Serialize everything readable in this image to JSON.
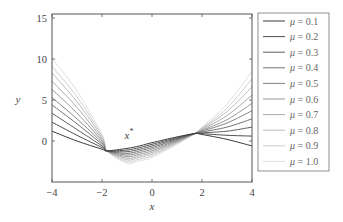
{
  "chart_data": {
    "type": "line",
    "title": "",
    "xlabel": "x",
    "ylabel": "y",
    "xlim": [
      -4,
      4
    ],
    "ylim": [
      -5,
      15.5
    ],
    "xticks": [
      -4,
      -2,
      0,
      2,
      4
    ],
    "yticks": [
      0,
      5,
      10,
      15
    ],
    "xtick_labels": [
      "−4",
      "−2",
      "0",
      "2",
      "4"
    ],
    "ytick_labels": [
      "0",
      "5",
      "10",
      "15"
    ],
    "grid": false,
    "legend_position": "outside-right",
    "annotation": {
      "text": "x",
      "superscript": "*",
      "x": -1.1,
      "y": 0.3
    },
    "x": [
      -4,
      -3,
      -2,
      -1.8,
      -1,
      -0.5,
      0,
      1,
      1.7,
      2,
      3,
      4
    ],
    "series": [
      {
        "name": "μ = 0.1",
        "label_mu": "μ",
        "label_value": "= 0.1",
        "color": "#3a3a3a",
        "values": [
          1.2,
          0.0,
          -1.0,
          -1.2,
          -0.9,
          -0.6,
          -0.2,
          0.5,
          0.9,
          0.8,
          0.2,
          -0.6
        ]
      },
      {
        "name": "μ = 0.2",
        "label_mu": "μ",
        "label_value": "= 0.2",
        "color": "#4d4d4d",
        "values": [
          2.3,
          0.7,
          -0.8,
          -1.2,
          -1.1,
          -0.8,
          -0.4,
          0.4,
          0.9,
          0.9,
          0.7,
          0.6
        ]
      },
      {
        "name": "μ = 0.3",
        "label_mu": "μ",
        "label_value": "= 0.3",
        "color": "#5f5f5f",
        "values": [
          3.4,
          1.4,
          -0.6,
          -1.2,
          -1.3,
          -1.0,
          -0.6,
          0.3,
          0.9,
          1.0,
          1.2,
          1.7
        ]
      },
      {
        "name": "μ = 0.4",
        "label_mu": "μ",
        "label_value": "= 0.4",
        "color": "#727272",
        "values": [
          4.4,
          2.1,
          -0.4,
          -1.2,
          -1.5,
          -1.2,
          -0.8,
          0.2,
          0.9,
          1.1,
          1.7,
          2.7
        ]
      },
      {
        "name": "μ = 0.5",
        "label_mu": "μ",
        "label_value": "= 0.5",
        "color": "#858585",
        "values": [
          5.3,
          2.7,
          -0.2,
          -1.2,
          -1.7,
          -1.4,
          -1.0,
          0.1,
          0.9,
          1.2,
          2.2,
          3.7
        ]
      },
      {
        "name": "μ = 0.6",
        "label_mu": "μ",
        "label_value": "= 0.6",
        "color": "#979797",
        "values": [
          6.3,
          3.4,
          0.0,
          -1.2,
          -1.9,
          -1.6,
          -1.2,
          0.0,
          0.9,
          1.3,
          2.6,
          4.6
        ]
      },
      {
        "name": "μ = 0.7",
        "label_mu": "μ",
        "label_value": "= 0.7",
        "color": "#aaaaaa",
        "values": [
          7.3,
          4.1,
          0.2,
          -1.2,
          -2.1,
          -1.8,
          -1.4,
          -0.1,
          0.9,
          1.4,
          3.1,
          5.6
        ]
      },
      {
        "name": "μ = 0.8",
        "label_mu": "μ",
        "label_value": "= 0.8",
        "color": "#bcbcbc",
        "values": [
          8.3,
          4.8,
          0.4,
          -1.2,
          -2.3,
          -2.0,
          -1.6,
          -0.2,
          0.9,
          1.5,
          3.6,
          6.6
        ]
      },
      {
        "name": "μ = 0.9",
        "label_mu": "μ",
        "label_value": "= 0.9",
        "color": "#cecece",
        "values": [
          9.1,
          5.4,
          0.6,
          -1.2,
          -2.5,
          -2.2,
          -1.8,
          -0.3,
          0.9,
          1.6,
          4.0,
          7.6
        ]
      },
      {
        "name": "μ = 1.0",
        "label_mu": "μ",
        "label_value": "= 1.0",
        "color": "#e0e0e0",
        "values": [
          10.1,
          6.1,
          0.8,
          -1.2,
          -2.7,
          -2.4,
          -2.0,
          -0.4,
          0.9,
          1.7,
          4.5,
          8.5
        ]
      }
    ]
  },
  "plot": {
    "frame_color": "#555555",
    "legend_border_color": "#777777"
  }
}
